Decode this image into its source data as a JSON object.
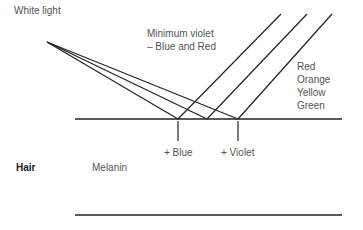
{
  "labels": {
    "white_light": "White light",
    "min_violet_line1": "Minimum violet",
    "min_violet_line2": "– Blue and Red",
    "colors": [
      "Red",
      "Orange",
      "Yellow",
      "Green"
    ],
    "plus_blue": "+ Blue",
    "plus_violet": "+ Violet",
    "hair": "Hair",
    "melanin": "Melanin"
  }
}
